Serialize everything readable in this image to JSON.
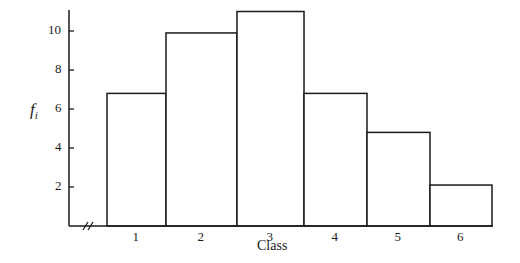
{
  "chart_data": {
    "type": "bar",
    "title": "",
    "xlabel": "Class",
    "ylabel": "f_i",
    "ylabel_main": "f",
    "ylabel_sub": "i",
    "categories": [
      "1",
      "2",
      "3",
      "4",
      "5",
      "6"
    ],
    "values": [
      6.8,
      9.9,
      11.0,
      6.8,
      4.8,
      2.1
    ],
    "yticks": [
      "2",
      "4",
      "6",
      "8",
      "10"
    ],
    "ylim": [
      0,
      11.5
    ],
    "grid": false,
    "legend": "none",
    "histogram": true,
    "x_axis_break": true,
    "bar_edges_px": [
      107,
      166,
      237,
      304,
      367,
      430,
      492
    ],
    "bar_fill": "#ffffff",
    "bar_stroke": "#1a1a1a"
  }
}
